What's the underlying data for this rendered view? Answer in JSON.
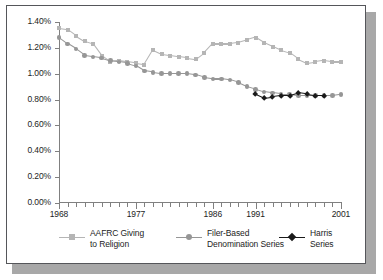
{
  "chart_data": {
    "type": "line",
    "title": "",
    "subtitle": "",
    "xlabel": "",
    "ylabel": "",
    "xlim": [
      1968,
      2001
    ],
    "ylim": [
      0.0,
      1.4
    ],
    "ytick_labels": [
      "0.00%",
      "0.20%",
      "0.40%",
      "0.60%",
      "0.80%",
      "1.00%",
      "1.20%",
      "1.40%"
    ],
    "ytick_values": [
      0.0,
      0.2,
      0.4,
      0.6,
      0.8,
      1.0,
      1.2,
      1.4
    ],
    "xtick_labels": [
      "1968",
      "1977",
      "1986",
      "1991",
      "2001"
    ],
    "xtick_values": [
      1968,
      1977,
      1986,
      1991,
      2001
    ],
    "grid": false,
    "legend_position": "bottom",
    "x": [
      1968,
      1969,
      1970,
      1971,
      1972,
      1973,
      1974,
      1975,
      1976,
      1977,
      1978,
      1979,
      1980,
      1981,
      1982,
      1983,
      1984,
      1985,
      1986,
      1987,
      1988,
      1989,
      1990,
      1991,
      1992,
      1993,
      1994,
      1995,
      1996,
      1997,
      1998,
      1999,
      2000,
      2001
    ],
    "series": [
      {
        "name": "AAFRC Giving to Religion",
        "color": "#b5b5b5",
        "marker": "square",
        "x": [
          1968,
          1969,
          1970,
          1971,
          1972,
          1973,
          1974,
          1975,
          1976,
          1977,
          1978,
          1979,
          1980,
          1981,
          1982,
          1983,
          1984,
          1985,
          1986,
          1987,
          1988,
          1989,
          1990,
          1991,
          1992,
          1993,
          1994,
          1995,
          1996,
          1997,
          1998,
          1999,
          2000,
          2001
        ],
        "values": [
          1.35,
          1.34,
          1.29,
          1.25,
          1.23,
          1.14,
          1.09,
          1.1,
          1.09,
          1.08,
          1.07,
          1.18,
          1.15,
          1.14,
          1.13,
          1.12,
          1.11,
          1.16,
          1.23,
          1.23,
          1.23,
          1.24,
          1.26,
          1.28,
          1.24,
          1.21,
          1.18,
          1.16,
          1.11,
          1.08,
          1.09,
          1.1,
          1.09,
          1.09
        ]
      },
      {
        "name": "Filer-Based Denomination Series",
        "color": "#969696",
        "marker": "circle",
        "x": [
          1968,
          1969,
          1970,
          1971,
          1972,
          1973,
          1974,
          1975,
          1976,
          1977,
          1978,
          1979,
          1980,
          1981,
          1982,
          1983,
          1984,
          1985,
          1986,
          1987,
          1988,
          1989,
          1990,
          1991,
          1992,
          1993,
          1994,
          1995,
          1996,
          1997,
          1998,
          1999,
          2000,
          2001
        ],
        "values": [
          1.28,
          1.23,
          1.19,
          1.14,
          1.13,
          1.12,
          1.1,
          1.09,
          1.08,
          1.06,
          1.02,
          1.01,
          1.0,
          1.0,
          1.0,
          1.0,
          0.99,
          0.97,
          0.96,
          0.96,
          0.95,
          0.93,
          0.9,
          0.88,
          0.86,
          0.85,
          0.84,
          0.84,
          0.83,
          0.83,
          0.83,
          0.83,
          0.83,
          0.84
        ]
      },
      {
        "name": "Harris Series",
        "color": "#1a1a1a",
        "marker": "diamond",
        "x": [
          1991,
          1992,
          1993,
          1994,
          1995,
          1996,
          1997,
          1998,
          1999
        ],
        "values": [
          0.84,
          0.81,
          0.82,
          0.83,
          0.83,
          0.85,
          0.84,
          0.83,
          0.83
        ]
      }
    ]
  },
  "legend": {
    "items": [
      {
        "label_line1": "AAFRC Giving",
        "label_line2": "to Religion"
      },
      {
        "label_line1": "Filer-Based",
        "label_line2": "Denomination Series"
      },
      {
        "label_line1": "Harris",
        "label_line2": "Series"
      }
    ]
  },
  "colors": {
    "aafrc": "#b5b5b5",
    "filer": "#969696",
    "harris": "#1a1a1a",
    "axis": "#808080",
    "frame": "#55565a",
    "shadow": "#a8a8a8",
    "text": "#1d1d1d"
  }
}
